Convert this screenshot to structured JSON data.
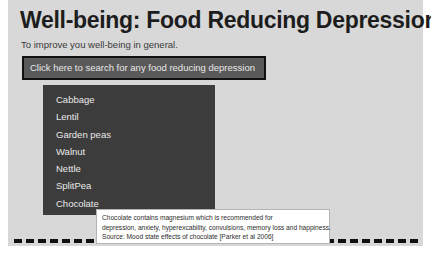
{
  "page": {
    "title": "Well-being: Food Reducing Depression",
    "subtitle": "To improve you well-being in general.",
    "background_color": "#d8d8d8",
    "margin_color": "#ffffff"
  },
  "search": {
    "button_label": "Click here to search for any food reducing depression",
    "button_fill": "#5a5a5a",
    "button_border": "#111111",
    "button_text_color": "#e8e8e8"
  },
  "dropdown": {
    "panel_color": "#3c3c3c",
    "text_color": "#e9e9e9",
    "items": [
      {
        "label": "Cabbage"
      },
      {
        "label": "Lentil"
      },
      {
        "label": "Garden peas"
      },
      {
        "label": "Walnut"
      },
      {
        "label": "Nettle"
      },
      {
        "label": "SplitPea"
      },
      {
        "label": "Chocolate"
      }
    ]
  },
  "tooltip": {
    "line1": "Chocolate contains magnesium which is recommended for",
    "line2": "depression, anxiety, hyperexcability, convulsions, memory loss and happiness.",
    "line3": "Source: Mood state effects of chocolate [Parker et al 2006]",
    "background": "#ffffff",
    "border_color": "#b4b4b4"
  },
  "divider": {
    "style": "dashed",
    "color": "#111111"
  }
}
